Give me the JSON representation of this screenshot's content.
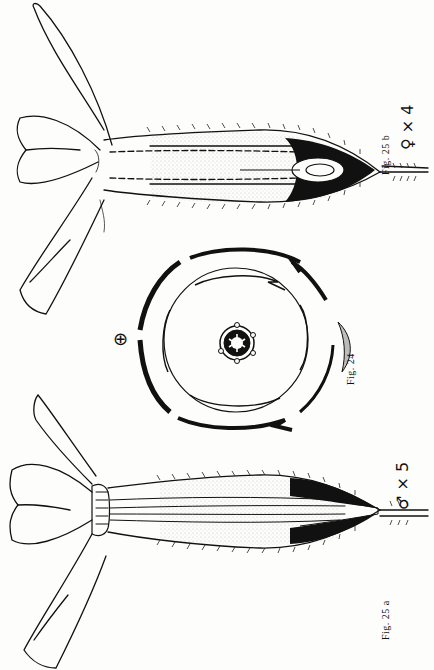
{
  "plate": {
    "figures": [
      {
        "id": "fig-25b",
        "caption": "Fig. 25 b",
        "sex_symbol": "♀",
        "magnification": "× 4",
        "description": "Longitudinal section of female flower"
      },
      {
        "id": "fig-24",
        "caption": "Fig. 24",
        "floral_symbol": "⊕",
        "description": "Floral diagram (actinomorphic)"
      },
      {
        "id": "fig-25a",
        "caption": "Fig. 25 a",
        "sex_symbol": "♂",
        "magnification": "× 5",
        "description": "Longitudinal section of male flower"
      }
    ],
    "colors": {
      "ink": "#111111",
      "paper": "#fdfdfb"
    }
  }
}
